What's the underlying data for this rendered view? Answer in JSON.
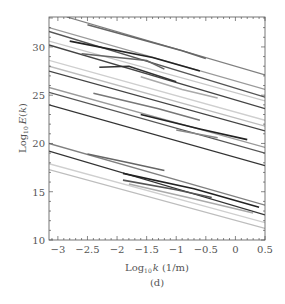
{
  "chart_data": {
    "type": "line",
    "title": "",
    "panel_label": "(d)",
    "xlabel": "Log10 k (1/m)",
    "ylabel": "Log10 E(k)",
    "xlim": [
      -3.15,
      0.5
    ],
    "ylim": [
      10,
      33.1
    ],
    "x_ticks": [
      -3,
      -2.5,
      -2,
      -1.5,
      -1,
      -0.5,
      0,
      0.5
    ],
    "x_tick_labels": [
      "−3",
      "−2.5",
      "−2",
      "−1.5",
      "−1",
      "−0.5",
      "0",
      "0.5"
    ],
    "y_ticks": [
      10,
      15,
      20,
      25,
      30
    ],
    "y_tick_labels": [
      "10",
      "15",
      "20",
      "25",
      "30"
    ],
    "grid": false,
    "legend": null,
    "fit_lines": [
      {
        "x": [
          -2.85,
          0.5
        ],
        "y": [
          33.1,
          27.1
        ],
        "color": "#808080"
      },
      {
        "x": [
          -3.15,
          0.5
        ],
        "y": [
          32.0,
          25.6
        ],
        "color": "#9a9a9a"
      },
      {
        "x": [
          -3.15,
          0.5
        ],
        "y": [
          31.6,
          24.8
        ],
        "color": "#555555"
      },
      {
        "x": [
          -3.15,
          0.5
        ],
        "y": [
          30.6,
          24.4
        ],
        "color": "#c8c8c8"
      },
      {
        "x": [
          -3.15,
          0.5
        ],
        "y": [
          30.2,
          23.6
        ],
        "color": "#444444"
      },
      {
        "x": [
          -3.15,
          0.5
        ],
        "y": [
          28.6,
          22.4
        ],
        "color": "#cfcfcf"
      },
      {
        "x": [
          -3.15,
          0.5
        ],
        "y": [
          28.0,
          21.8
        ],
        "color": "#bdbdbd"
      },
      {
        "x": [
          -3.15,
          0.5
        ],
        "y": [
          27.5,
          21.3
        ],
        "color": "#444444"
      },
      {
        "x": [
          -3.15,
          0.5
        ],
        "y": [
          25.8,
          19.6
        ],
        "color": "#9a9a9a"
      },
      {
        "x": [
          -3.15,
          0.5
        ],
        "y": [
          25.3,
          19.0
        ],
        "color": "#555555"
      },
      {
        "x": [
          -3.15,
          0.5
        ],
        "y": [
          24.0,
          17.7
        ],
        "color": "#333333"
      },
      {
        "x": [
          -3.15,
          0.5
        ],
        "y": [
          20.0,
          13.6
        ],
        "color": "#808080"
      },
      {
        "x": [
          -3.15,
          0.5
        ],
        "y": [
          19.2,
          12.6
        ],
        "color": "#333333"
      },
      {
        "x": [
          -3.15,
          0.5
        ],
        "y": [
          17.9,
          11.8
        ],
        "color": "#cfcfcf"
      },
      {
        "x": [
          -3.15,
          0.5
        ],
        "y": [
          17.3,
          11.2
        ],
        "color": "#bdbdbd"
      }
    ],
    "data_segments": [
      {
        "x": [
          -2.5,
          -0.9,
          -0.5
        ],
        "y": [
          32.3,
          29.6,
          28.8
        ],
        "color": "#666666"
      },
      {
        "x": [
          -2.8,
          -1.4,
          -0.6
        ],
        "y": [
          30.6,
          28.9,
          27.5
        ],
        "color": "#222222"
      },
      {
        "x": [
          -2.6,
          -1.5,
          -1.2
        ],
        "y": [
          29.3,
          28.6,
          27.7
        ],
        "color": "#666666"
      },
      {
        "x": [
          -2.3,
          -1.8,
          -1.0
        ],
        "y": [
          27.9,
          28.0,
          26.4
        ],
        "color": "#333333"
      },
      {
        "x": [
          -1.6,
          -0.9,
          -0.3
        ],
        "y": [
          26.9,
          25.6,
          24.7
        ],
        "color": "#aaaaaa"
      },
      {
        "x": [
          -2.4,
          -1.3,
          -0.6
        ],
        "y": [
          25.2,
          23.6,
          22.4
        ],
        "color": "#777777"
      },
      {
        "x": [
          -1.6,
          -0.6,
          0.2
        ],
        "y": [
          23.0,
          21.5,
          20.4
        ],
        "color": "#222222"
      },
      {
        "x": [
          -1.0,
          -0.3
        ],
        "y": [
          21.4,
          20.6
        ],
        "color": "#888888"
      },
      {
        "x": [
          -2.5,
          -1.8,
          -1.2
        ],
        "y": [
          18.9,
          18.0,
          17.2
        ],
        "color": "#666666"
      },
      {
        "x": [
          -1.9,
          -0.7,
          0.4
        ],
        "y": [
          16.9,
          15.3,
          13.4
        ],
        "color": "#222222"
      },
      {
        "x": [
          -1.9,
          -1.0,
          -0.4
        ],
        "y": [
          16.2,
          15.2,
          14.4
        ],
        "color": "#555555"
      },
      {
        "x": [
          -1.8,
          -0.8,
          0.3
        ],
        "y": [
          15.8,
          14.4,
          12.8
        ],
        "color": "#aaaaaa"
      }
    ]
  },
  "caption": "(d)",
  "axes": {
    "x_title_base": "Log",
    "x_title_sub": "10",
    "x_title_rest": "k (1/m)",
    "y_title_base": "Log",
    "y_title_sub": "10",
    "y_title_rest": "E(k)"
  }
}
